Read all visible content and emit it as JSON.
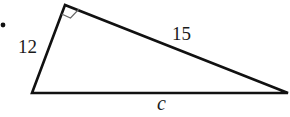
{
  "diagram": {
    "type": "right-triangle",
    "bullet": "•",
    "labels": {
      "leg_short": "12",
      "leg_long": "15",
      "hypotenuse": "c"
    },
    "right_angle_marker": true,
    "colors": {
      "stroke": "#111111",
      "marker": "#555555"
    }
  }
}
